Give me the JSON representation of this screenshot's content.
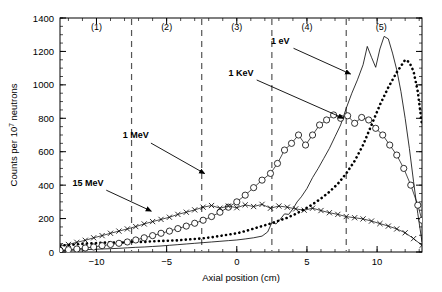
{
  "chart_data": {
    "type": "line",
    "title": "",
    "xlabel": "Axial position (cm)",
    "ylabel": "Counts per 10⁷ neutrons",
    "ylabel_parts": {
      "prefix": "Counts per 10",
      "sup": "7",
      "suffix": " neutrons"
    },
    "xlim": [
      -12.6,
      13.2
    ],
    "ylim": [
      0,
      1400
    ],
    "xticks": [
      -10,
      -5,
      0,
      5,
      10
    ],
    "xtick_labels": [
      "−10",
      "−5",
      "0",
      "5",
      "10"
    ],
    "yticks": [
      0,
      200,
      400,
      600,
      800,
      1000,
      1200,
      1400
    ],
    "ytick_labels": [
      "0",
      "200",
      "400",
      "600",
      "800",
      "1000",
      "1200",
      "1400"
    ],
    "grid": false,
    "legend": "none",
    "region_dividers": [
      -7.5,
      -2.5,
      2.5,
      7.8
    ],
    "region_labels": [
      {
        "text": "(1)",
        "x": -10.0,
        "y": 1330
      },
      {
        "text": "(2)",
        "x": -5.0,
        "y": 1330
      },
      {
        "text": "(3)",
        "x": 0.0,
        "y": 1330
      },
      {
        "text": "(4)",
        "x": 5.0,
        "y": 1330
      },
      {
        "text": "(5)",
        "x": 10.3,
        "y": 1330
      }
    ],
    "annotations": [
      {
        "text": "1 eV",
        "label_x": 3.1,
        "label_y": 1245,
        "arrow_to_x": 8.1,
        "arrow_to_y": 1065
      },
      {
        "text": "1 KeV",
        "label_x": 0.3,
        "label_y": 1055,
        "arrow_to_x": 7.6,
        "arrow_to_y": 800
      },
      {
        "text": "1 MeV",
        "label_x": -7.2,
        "label_y": 680,
        "arrow_to_x": -2.3,
        "arrow_to_y": 470
      },
      {
        "text": "15 MeV",
        "label_x": -10.6,
        "label_y": 395,
        "arrow_to_x": -6.1,
        "arrow_to_y": 245
      }
    ],
    "series": [
      {
        "name": "1 eV",
        "marker": "none",
        "style": "thin-solid",
        "color": "#000000",
        "x": [
          -12.6,
          -12.0,
          -11.4,
          -10.8,
          -10.2,
          -9.6,
          -9.0,
          -8.4,
          -7.8,
          -7.2,
          -6.6,
          -6.0,
          -5.4,
          -4.8,
          -4.2,
          -3.6,
          -3.0,
          -2.4,
          -1.8,
          -1.2,
          -0.6,
          0.0,
          0.6,
          1.2,
          1.8,
          2.2,
          2.5,
          2.8,
          3.1,
          3.4,
          3.7,
          4.0,
          4.3,
          4.6,
          5.0,
          5.4,
          5.8,
          6.2,
          6.6,
          7.0,
          7.4,
          7.8,
          8.2,
          8.6,
          9.0,
          9.3,
          9.6,
          9.9,
          10.2,
          10.5,
          10.8,
          11.1,
          11.4,
          11.7,
          12.0,
          12.3,
          12.6,
          12.9,
          13.2
        ],
        "y": [
          8,
          10,
          12,
          14,
          16,
          18,
          20,
          22,
          25,
          28,
          30,
          33,
          36,
          40,
          44,
          48,
          52,
          56,
          60,
          64,
          68,
          72,
          78,
          85,
          95,
          120,
          175,
          168,
          196,
          228,
          225,
          258,
          300,
          330,
          380,
          445,
          500,
          560,
          620,
          690,
          760,
          860,
          950,
          1030,
          1120,
          1230,
          1165,
          1105,
          1215,
          1290,
          1275,
          1190,
          1090,
          960,
          800,
          620,
          420,
          230,
          60
        ]
      },
      {
        "name": "1 KeV",
        "marker": "filled-square",
        "style": "bold-dotted",
        "color": "#000000",
        "x": [
          -12.6,
          -12.0,
          -11.4,
          -10.8,
          -10.2,
          -9.6,
          -9.0,
          -8.4,
          -7.8,
          -7.2,
          -6.6,
          -6.0,
          -5.4,
          -4.8,
          -4.2,
          -3.6,
          -3.0,
          -2.4,
          -1.8,
          -1.2,
          -0.6,
          0.0,
          0.6,
          1.2,
          1.8,
          2.4,
          3.0,
          3.6,
          4.2,
          4.8,
          5.4,
          6.0,
          6.6,
          7.2,
          7.8,
          8.4,
          9.0,
          9.6,
          10.2,
          10.8,
          11.4,
          12.0,
          12.3,
          12.6,
          12.9,
          13.2
        ],
        "y": [
          38,
          42,
          46,
          50,
          52,
          55,
          58,
          56,
          58,
          62,
          60,
          64,
          66,
          68,
          70,
          74,
          78,
          82,
          88,
          96,
          104,
          112,
          125,
          140,
          155,
          170,
          188,
          205,
          228,
          255,
          285,
          320,
          360,
          408,
          470,
          545,
          640,
          760,
          880,
          985,
          1075,
          1150,
          1135,
          1080,
          960,
          760
        ]
      },
      {
        "name": "1 MeV",
        "marker": "open-circle",
        "style": "thin-solid-markers",
        "color": "#000000",
        "x": [
          -12.6,
          -12.0,
          -11.4,
          -10.8,
          -10.2,
          -9.6,
          -9.0,
          -8.4,
          -7.8,
          -7.2,
          -6.6,
          -6.0,
          -5.4,
          -4.8,
          -4.2,
          -3.6,
          -3.0,
          -2.4,
          -1.8,
          -1.2,
          -0.6,
          0.0,
          0.6,
          1.2,
          1.8,
          2.4,
          2.9,
          3.4,
          3.9,
          4.4,
          4.9,
          5.4,
          5.9,
          6.4,
          6.9,
          7.4,
          7.9,
          8.4,
          8.9,
          9.4,
          9.9,
          10.4,
          10.9,
          11.4,
          11.9,
          12.4,
          12.9,
          13.2
        ],
        "y": [
          10,
          14,
          18,
          24,
          30,
          38,
          45,
          52,
          60,
          72,
          85,
          98,
          112,
          125,
          140,
          155,
          172,
          190,
          212,
          238,
          268,
          300,
          340,
          385,
          430,
          470,
          530,
          610,
          650,
          700,
          640,
          700,
          760,
          790,
          820,
          800,
          815,
          770,
          805,
          790,
          740,
          700,
          640,
          580,
          500,
          400,
          280,
          190
        ]
      },
      {
        "name": "15 MeV",
        "marker": "cross",
        "style": "thin-solid-markers",
        "color": "#000000",
        "x": [
          -12.6,
          -12.0,
          -11.4,
          -10.8,
          -10.2,
          -9.6,
          -9.0,
          -8.4,
          -7.8,
          -7.2,
          -6.6,
          -6.0,
          -5.4,
          -4.8,
          -4.2,
          -3.6,
          -3.0,
          -2.4,
          -1.8,
          -1.2,
          -0.6,
          0.0,
          0.6,
          1.2,
          1.8,
          2.4,
          3.0,
          3.6,
          4.2,
          4.8,
          5.4,
          6.0,
          6.6,
          7.2,
          7.8,
          8.4,
          9.0,
          9.6,
          10.2,
          10.8,
          11.4,
          12.0,
          12.6,
          13.2
        ],
        "y": [
          35,
          45,
          58,
          70,
          85,
          98,
          112,
          125,
          138,
          152,
          168,
          182,
          195,
          208,
          225,
          238,
          252,
          268,
          278,
          262,
          275,
          265,
          282,
          272,
          285,
          262,
          275,
          268,
          258,
          250,
          262,
          248,
          235,
          225,
          212,
          205,
          198,
          185,
          170,
          155,
          138,
          115,
          80,
          40
        ]
      }
    ]
  },
  "figure": {
    "background": "#ffffff",
    "axis_color": "#000000"
  }
}
